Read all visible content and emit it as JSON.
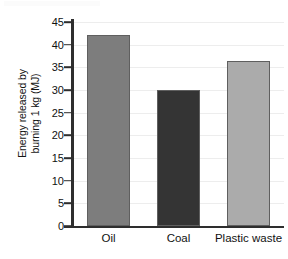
{
  "chart_data": {
    "type": "bar",
    "title": "",
    "xlabel": "",
    "ylabel": "Energy released by burning 1 kg (MJ)",
    "ylabel_lines": [
      "Energy released by",
      "burning 1 kg (MJ)"
    ],
    "categories": [
      "Oil",
      "Coal",
      "Plastic waste"
    ],
    "values": [
      42.2,
      30.0,
      36.5
    ],
    "bar_colors": [
      "#7d7d7d",
      "#343434",
      "#ababab"
    ],
    "bar_edge_color": "#5f5f5f",
    "ylim": [
      0,
      45
    ],
    "yticks": [
      0,
      5,
      10,
      15,
      20,
      25,
      30,
      35,
      40,
      45
    ],
    "ytick_labels": [
      "0",
      "5",
      "10",
      "15",
      "20",
      "25",
      "30",
      "35",
      "40",
      "45"
    ],
    "grid": true,
    "gridline_color": "#ededed",
    "axis_color": "#2e2e2e",
    "background": "#ffffff",
    "legend": null,
    "legend_position": "none",
    "series": [
      {
        "name": "Energy released by burning 1 kg (MJ)",
        "values": [
          42.2,
          30.0,
          36.5
        ]
      }
    ]
  }
}
